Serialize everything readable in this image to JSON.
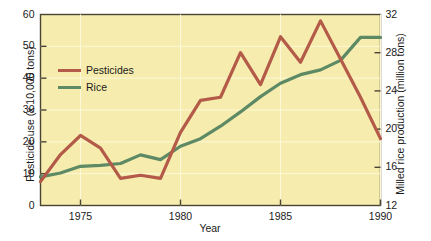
{
  "chart_data": {
    "type": "line",
    "title": "",
    "xlabel": "Year",
    "ylabel": "Pesticide use (x 10,000 tons)",
    "ylabel_right": "Milled rice production (million tons)",
    "xlim": [
      1973,
      1990
    ],
    "ylim": [
      0,
      60
    ],
    "ylim_right": [
      12,
      32
    ],
    "xticks": [
      1975,
      1980,
      1985,
      1990
    ],
    "xtick_labels": [
      "1975",
      "1980",
      "1985",
      "1990"
    ],
    "yticks": [
      0,
      10,
      20,
      30,
      40,
      50,
      60
    ],
    "ytick_labels": [
      "0",
      "10",
      "20",
      "30",
      "40",
      "50",
      "60"
    ],
    "yticks_right": [
      12,
      16,
      20,
      24,
      28,
      32
    ],
    "ytick_labels_right": [
      "12",
      "16",
      "20",
      "24",
      "28",
      "32"
    ],
    "grid": true,
    "legend_position": "upper left",
    "plot_background": "#f6ecae",
    "x": [
      1973,
      1974,
      1975,
      1976,
      1977,
      1978,
      1979,
      1980,
      1981,
      1982,
      1983,
      1984,
      1985,
      1986,
      1987,
      1988,
      1989,
      1990
    ],
    "series": [
      {
        "name": "Pesticides",
        "axis": "left",
        "color": "#b35a48",
        "units": "x 10,000 tons",
        "values": [
          7.5,
          16,
          22,
          18,
          8.5,
          9.5,
          8.5,
          23,
          33,
          34,
          48,
          38,
          53,
          45,
          58,
          46,
          34,
          21
        ]
      },
      {
        "name": "Rice",
        "axis": "right",
        "color": "#5d8a64",
        "units": "million tons",
        "values": [
          15.0,
          15.4,
          16.1,
          16.2,
          16.4,
          17.3,
          16.8,
          18.2,
          19.0,
          20.3,
          21.8,
          23.4,
          24.8,
          25.7,
          26.2,
          27.2,
          29.6,
          29.6
        ],
        "values_left_axis_equivalent": [
          9,
          10.2,
          12.3,
          12.6,
          13.2,
          15.9,
          14.4,
          18.6,
          21,
          24.9,
          29.4,
          34.2,
          38.4,
          41.1,
          42.6,
          45.6,
          53,
          55
        ]
      }
    ]
  },
  "legend": {
    "items": [
      {
        "label": "Pesticides",
        "color": "#b35a48"
      },
      {
        "label": "Rice",
        "color": "#5d8a64"
      }
    ]
  },
  "axes": {
    "x_title": "Year",
    "y_left_title": "Pesticide use (x 10,000 tons)",
    "y_right_title": "Milled rice production (million tons)"
  }
}
